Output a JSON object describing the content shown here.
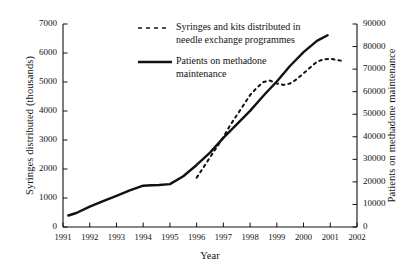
{
  "chart_data": {
    "type": "line",
    "title": "",
    "xlabel": "Year",
    "ylabel": "Syringes distributed (thousands)",
    "ylabel_right": "Patients on methadone maintenance",
    "xlim": [
      1991,
      2002
    ],
    "ylim": [
      0,
      7000
    ],
    "ylim_right": [
      0,
      90000
    ],
    "grid": false,
    "legend_position": "top-center",
    "xticks": [
      "1991",
      "1992",
      "1993",
      "1994",
      "1995",
      "1996",
      "1997",
      "1998",
      "1999",
      "2000",
      "2001",
      "2002"
    ],
    "yticks_left": [
      "0",
      "1000",
      "2000",
      "3000",
      "4000",
      "5000",
      "6000",
      "7000"
    ],
    "yticks_right": [
      "0",
      "10000",
      "20000",
      "30000",
      "40000",
      "50000",
      "60000",
      "70000",
      "80000",
      "90000"
    ],
    "series": [
      {
        "name": "Syringes and kits distributed in\nneedle exchange programmes",
        "style": "dashed",
        "axis": "left",
        "color": "#111111",
        "x": [
          1996.0,
          1996.25,
          1996.5,
          1996.75,
          1997.0,
          1997.25,
          1997.5,
          1997.75,
          1998.0,
          1998.25,
          1998.5,
          1998.75,
          1999.0,
          1999.25,
          1999.5,
          1999.75,
          2000.0,
          2000.25,
          2000.5,
          2000.75,
          2001.0,
          2001.25,
          2001.5
        ],
        "values": [
          1700,
          2050,
          2400,
          2750,
          3100,
          3500,
          3850,
          4200,
          4550,
          4800,
          5000,
          5050,
          4950,
          4900,
          4950,
          5100,
          5300,
          5500,
          5700,
          5780,
          5800,
          5760,
          5720
        ]
      },
      {
        "name": "Patients on methadone\nmaintenance",
        "style": "solid",
        "axis": "right",
        "color": "#111111",
        "x": [
          1991.2,
          1991.5,
          1992.0,
          1992.5,
          1993.0,
          1993.5,
          1994.0,
          1994.3,
          1994.6,
          1995.0,
          1995.5,
          1996.0,
          1996.5,
          1997.0,
          1997.5,
          1998.0,
          1998.3,
          1998.6,
          1999.0,
          1999.5,
          2000.0,
          2000.5,
          2000.9
        ],
        "values": [
          5100,
          6200,
          9000,
          11500,
          13800,
          16200,
          18300,
          18500,
          18600,
          19000,
          22500,
          27500,
          33000,
          39500,
          45500,
          51500,
          55500,
          59500,
          64500,
          71500,
          77500,
          82500,
          85000
        ]
      }
    ]
  },
  "legend": {
    "entries": [
      {
        "label": "Syringes and kits distributed in\nneedle exchange programmes",
        "marker": "dashed-line-marker"
      },
      {
        "label": "Patients on methadone\nmaintenance",
        "marker": "solid-line-marker"
      }
    ]
  },
  "footer": {
    "fragment": ""
  }
}
